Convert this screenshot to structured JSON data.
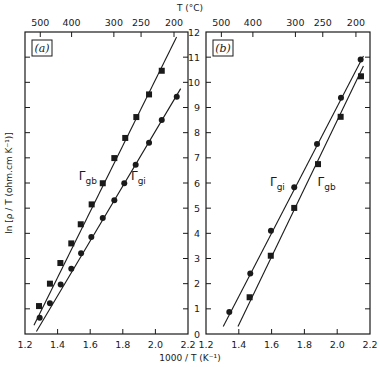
{
  "figure": {
    "top_axis_title": "T (°C)",
    "bottom_axis_title": "1000 / T (K⁻¹)",
    "left_axis_title": "ln [ρ / T (ohm.cm K⁻¹)]"
  },
  "chart_data": [
    {
      "type": "scatter",
      "panel": "(a)",
      "title": "",
      "xlabel": "1000 / T (K^-1)",
      "ylabel": "ln [ρ / T (ohm.cm K^-1)]",
      "top_xlabel": "T (°C)",
      "xlim": [
        1.2,
        2.2
      ],
      "ylim": [
        0,
        12
      ],
      "x_ticks": [
        1.2,
        1.4,
        1.6,
        1.8,
        2.0,
        2.2
      ],
      "x_tick_labels": [
        "1.2",
        "1.4",
        "1.6",
        "1.8",
        "2.0",
        "2.2"
      ],
      "y_ticks": [
        0,
        1,
        2,
        3,
        4,
        5,
        6,
        7,
        8,
        9,
        10,
        11,
        12
      ],
      "top_ticks_celsius": [
        500,
        400,
        300,
        250,
        200
      ],
      "grid": false,
      "series": [
        {
          "name": "Γgb",
          "label_main": "Γ",
          "label_sub": "gb",
          "marker": "square",
          "label_pos": [
            1.53,
            6.1
          ],
          "line": [
            [
              1.255,
              0.35
            ],
            [
              2.13,
              11.8
            ]
          ],
          "x": [
            1.286,
            1.353,
            1.417,
            1.484,
            1.542,
            1.609,
            1.677,
            1.748,
            1.815,
            1.883,
            1.961,
            2.039
          ],
          "y": [
            1.11,
            2.0,
            2.82,
            3.6,
            4.36,
            5.15,
            5.99,
            6.99,
            7.79,
            8.62,
            9.52,
            10.46
          ]
        },
        {
          "name": "Γgi",
          "label_main": "Γ",
          "label_sub": "gi",
          "marker": "circle",
          "label_pos": [
            1.85,
            6.1
          ],
          "line": [
            [
              1.27,
              0.1
            ],
            [
              2.155,
              9.75
            ]
          ],
          "x": [
            1.29,
            1.353,
            1.419,
            1.484,
            1.544,
            1.607,
            1.677,
            1.748,
            1.809,
            1.879,
            1.961,
            2.039,
            2.131
          ],
          "y": [
            0.65,
            1.22,
            1.97,
            2.59,
            3.21,
            3.85,
            4.61,
            5.31,
            5.99,
            6.73,
            7.6,
            8.5,
            9.43
          ]
        }
      ]
    },
    {
      "type": "scatter",
      "panel": "(b)",
      "title": "",
      "xlabel": "1000 / T (K^-1)",
      "ylabel": "ln [ρ / T (ohm.cm K^-1)]",
      "top_xlabel": "T (°C)",
      "xlim": [
        1.2,
        2.2
      ],
      "ylim": [
        0,
        12
      ],
      "x_ticks": [
        1.2,
        1.4,
        1.6,
        1.8,
        2.0,
        2.2
      ],
      "x_tick_labels": [
        "1.2",
        "1.4",
        "1.6",
        "1.8",
        "2.0",
        "2.2"
      ],
      "y_ticks": [
        0,
        1,
        2,
        3,
        4,
        5,
        6,
        7,
        8,
        9,
        10,
        11,
        12
      ],
      "y_tick_labels": [
        "0",
        "1",
        "2",
        "3",
        "4",
        "5",
        "6",
        "7",
        "8",
        "9",
        "10",
        "11",
        "12"
      ],
      "top_ticks_celsius": [
        500,
        400,
        300,
        250,
        200
      ],
      "grid": false,
      "series": [
        {
          "name": "Γgi",
          "label_main": "Γ",
          "label_sub": "gi",
          "marker": "circle",
          "label_pos": [
            1.59,
            5.9
          ],
          "line": [
            [
              1.305,
              0.3
            ],
            [
              2.16,
              11.05
            ]
          ],
          "x": [
            1.342,
            1.47,
            1.596,
            1.738,
            1.877,
            2.023,
            2.143
          ],
          "y": [
            0.87,
            2.4,
            4.1,
            5.83,
            7.55,
            9.39,
            10.91
          ]
        },
        {
          "name": "Γgb",
          "label_main": "Γ",
          "label_sub": "gb",
          "marker": "square",
          "label_pos": [
            1.88,
            5.9
          ],
          "line": [
            [
              1.395,
              0.3
            ],
            [
              2.16,
              10.65
            ]
          ],
          "x": [
            1.466,
            1.595,
            1.738,
            1.883,
            2.021,
            2.145
          ],
          "y": [
            1.46,
            3.11,
            5.01,
            6.75,
            8.63,
            10.24
          ]
        }
      ]
    }
  ]
}
